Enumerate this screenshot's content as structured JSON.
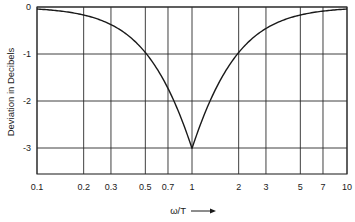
{
  "chart_data": {
    "type": "line",
    "title": "",
    "xlabel": "ω/T →",
    "ylabel": "Deviation in Decibels",
    "xscale": "log",
    "xlim": [
      0.1,
      10
    ],
    "ylim": [
      -3.5,
      0
    ],
    "grid": true,
    "legend": null,
    "x_ticks": [
      0.1,
      0.2,
      0.3,
      0.5,
      0.7,
      1,
      2,
      3,
      5,
      7,
      10
    ],
    "x_tick_labels": [
      "0.1",
      "0.2",
      "0.3",
      "0.5",
      "0.7",
      "1",
      "2",
      "3",
      "5",
      "7",
      "10"
    ],
    "y_ticks": [
      0,
      -1,
      -2,
      -3
    ],
    "y_tick_labels": [
      "0",
      "-1",
      "-2",
      "-3"
    ],
    "series": [
      {
        "name": "Deviation from asymptote",
        "x": [
          0.1,
          0.15,
          0.2,
          0.3,
          0.4,
          0.5,
          0.6,
          0.7,
          0.8,
          0.9,
          1,
          1.1,
          1.25,
          1.5,
          2,
          2.5,
          3,
          4,
          5,
          7,
          10
        ],
        "values": [
          -0.04,
          -0.1,
          -0.17,
          -0.37,
          -0.64,
          -0.97,
          -1.34,
          -1.74,
          -2.15,
          -2.57,
          -3.01,
          -2.59,
          -2.09,
          -1.6,
          -0.97,
          -0.64,
          -0.46,
          -0.26,
          -0.17,
          -0.09,
          -0.04
        ]
      }
    ]
  },
  "labels": {
    "ylabel": "Deviation in Decibels",
    "xlabel": "ω/T",
    "xlabel_arrow": "⟶"
  },
  "style": {
    "line_color": "#1a1a1a",
    "grid_color": "#2a2a2a",
    "background": "#ffffff"
  }
}
